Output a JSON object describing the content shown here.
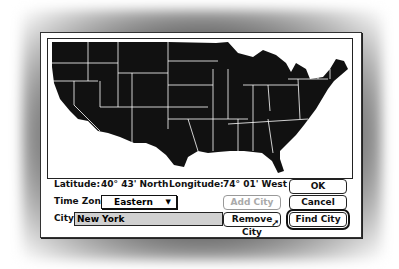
{
  "map": {
    "region": "Contiguous United States",
    "fill": "#111111",
    "borders": "#ffffff"
  },
  "location": {
    "latitude_label": "Latitude:",
    "latitude_value": "40° 43'  North",
    "longitude_label": "Longitude:",
    "longitude_value": "74° 01'  West"
  },
  "timezone": {
    "label": "Time Zone:",
    "selected": "Eastern",
    "arrow": "▼"
  },
  "city": {
    "label": "City:",
    "value": "New York"
  },
  "buttons": {
    "ok": "OK",
    "cancel": "Cancel",
    "add_city": "Add City",
    "remove_city": "Remove City",
    "find_city": "Find City"
  },
  "cursor": "arrow-pointer"
}
